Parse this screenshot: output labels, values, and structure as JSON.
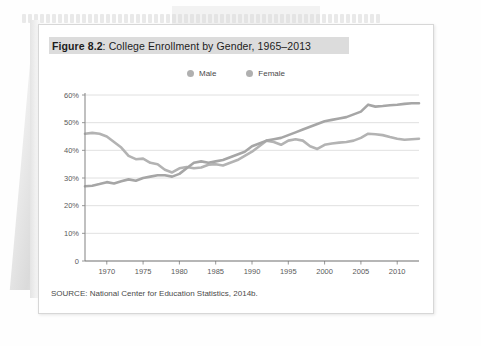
{
  "figure": {
    "number": "Figure 8.2",
    "separator": ": ",
    "title_text": "College Enrollment by Gender, 1965–2013",
    "full_title": "Figure 8.2: College Enrollment by Gender, 1965–2013",
    "source": "SOURCE: National Center for Education Statistics, 2014b."
  },
  "colors": {
    "male_line": "#b3b3b3",
    "female_line": "#a6a6a6",
    "gridline": "#d8d8d8",
    "axis": "#8c8c8c",
    "title_band": "#dcdcdc",
    "text": "#4a4a4a"
  },
  "chart_data": {
    "type": "line",
    "title": "College Enrollment by Gender, 1965–2013",
    "xlabel": "",
    "ylabel": "",
    "xlim": [
      1967,
      2013
    ],
    "ylim": [
      0,
      60
    ],
    "ytick_labels": [
      "0",
      "10%",
      "20%",
      "30%",
      "40%",
      "50%",
      "60%"
    ],
    "ytick_values": [
      0,
      10,
      20,
      30,
      40,
      50,
      60
    ],
    "xtick_labels": [
      "1970",
      "1975",
      "1980",
      "1985",
      "1990",
      "1995",
      "2000",
      "2005",
      "2010"
    ],
    "xtick_values": [
      1970,
      1975,
      1980,
      1985,
      1990,
      1995,
      2000,
      2005,
      2010
    ],
    "grid": true,
    "legend_position": "top-center",
    "x": [
      1967,
      1968,
      1969,
      1970,
      1971,
      1972,
      1973,
      1974,
      1975,
      1976,
      1977,
      1978,
      1979,
      1980,
      1981,
      1982,
      1983,
      1984,
      1985,
      1986,
      1987,
      1988,
      1989,
      1990,
      1991,
      1992,
      1993,
      1994,
      1995,
      1996,
      1997,
      1998,
      1999,
      2000,
      2001,
      2002,
      2003,
      2004,
      2005,
      2006,
      2007,
      2008,
      2009,
      2010,
      2011,
      2012,
      2013
    ],
    "series": [
      {
        "name": "Male",
        "color": "#b3b3b3",
        "values": [
          46.0,
          46.3,
          46.0,
          45.0,
          43.0,
          41.0,
          38.0,
          36.8,
          37.0,
          35.5,
          35.0,
          33.0,
          32.0,
          33.5,
          34.0,
          33.5,
          33.8,
          34.8,
          35.0,
          34.5,
          35.5,
          36.5,
          38.0,
          39.5,
          41.5,
          43.5,
          43.0,
          42.0,
          43.5,
          44.0,
          43.5,
          41.5,
          40.5,
          42.0,
          42.5,
          42.8,
          43.0,
          43.5,
          44.5,
          46.0,
          45.8,
          45.5,
          44.8,
          44.2,
          43.8,
          44.0,
          44.2
        ]
      },
      {
        "name": "Female",
        "color": "#a6a6a6",
        "values": [
          27.0,
          27.2,
          27.8,
          28.5,
          28.0,
          28.8,
          29.5,
          29.0,
          30.0,
          30.5,
          31.0,
          31.0,
          30.5,
          31.5,
          33.5,
          35.5,
          36.0,
          35.5,
          36.0,
          36.5,
          37.5,
          38.5,
          39.5,
          41.5,
          42.5,
          43.5,
          44.0,
          44.5,
          45.5,
          46.5,
          47.5,
          48.5,
          49.5,
          50.5,
          51.0,
          51.5,
          52.0,
          53.0,
          54.0,
          56.5,
          55.8,
          56.0,
          56.3,
          56.5,
          56.8,
          57.0,
          57.0
        ]
      }
    ]
  }
}
